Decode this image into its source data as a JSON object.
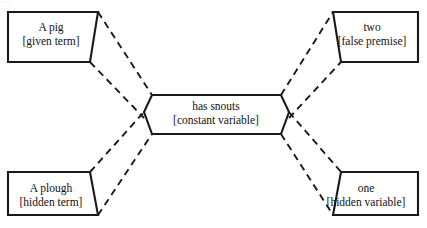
{
  "diagram": {
    "type": "bowtie-analogy-diagram",
    "background_color": "#ffffff",
    "line_color": "#1a1a1a",
    "text_color": "#111111",
    "top_artifact": "''''",
    "nodes": [
      {
        "id": "top-left",
        "name": "given-term-node",
        "line1": "A pig",
        "line2": "[given term]",
        "shape": "rect-slanted-right"
      },
      {
        "id": "top-right",
        "name": "false-premise-node",
        "line1": "two",
        "line2": "[false premise]",
        "shape": "rect-slanted-left"
      },
      {
        "id": "center",
        "name": "constant-variable-node",
        "line1": "has snouts",
        "line2": "[constant variable]",
        "shape": "hexagon-concave"
      },
      {
        "id": "bottom-left",
        "name": "hidden-term-node",
        "line1": "A plough",
        "line2": "[hidden term]",
        "shape": "rect-slanted-right"
      },
      {
        "id": "bottom-right",
        "name": "hidden-variable-node",
        "line1": "one",
        "line2": "[hidden variable]",
        "shape": "rect-slanted-left"
      }
    ],
    "connectors": [
      {
        "name": "connector-top-left-to-center",
        "style": "dashed-band"
      },
      {
        "name": "connector-bottom-left-to-center",
        "style": "dashed-band"
      },
      {
        "name": "connector-center-to-top-right",
        "style": "dashed-band"
      },
      {
        "name": "connector-center-to-bottom-right",
        "style": "dashed-band"
      }
    ]
  }
}
